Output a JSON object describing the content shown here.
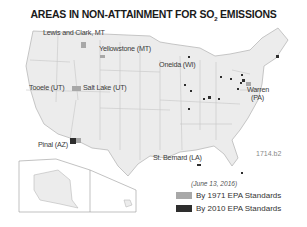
{
  "title": {
    "main": "AREAS IN NON-ATTAINMENT FOR SO",
    "subscript": "2",
    "suffix": " EMISSIONS"
  },
  "labels": [
    {
      "text": "Lewis and Clark, MT",
      "x": 43,
      "y": 28
    },
    {
      "text": "Yellowstone (MT)",
      "x": 99,
      "y": 44
    },
    {
      "text": "Oneida (WI)",
      "x": 159,
      "y": 60
    },
    {
      "text": "Tooele (UT)",
      "x": 29,
      "y": 83
    },
    {
      "text": "Salt Lake (UT)",
      "x": 83,
      "y": 83
    },
    {
      "text": "Warren",
      "x": 247,
      "y": 85
    },
    {
      "text": "(PA)",
      "x": 251,
      "y": 93
    },
    {
      "text": "Pinal (AZ)",
      "x": 38,
      "y": 140
    },
    {
      "text": "St. Bernard (LA)",
      "x": 153,
      "y": 153
    }
  ],
  "figure_code": "1714.b2",
  "legend": {
    "date": "(June 13, 2016)",
    "items": [
      {
        "label": "By 1971 EPA Standards",
        "color": "#a8a8a8"
      },
      {
        "label": "By 2010 EPA Standards",
        "color": "#2e2e2e"
      }
    ]
  },
  "colors": {
    "land": "#ececec",
    "border": "#b9b9b9",
    "background": "#ffffff"
  }
}
